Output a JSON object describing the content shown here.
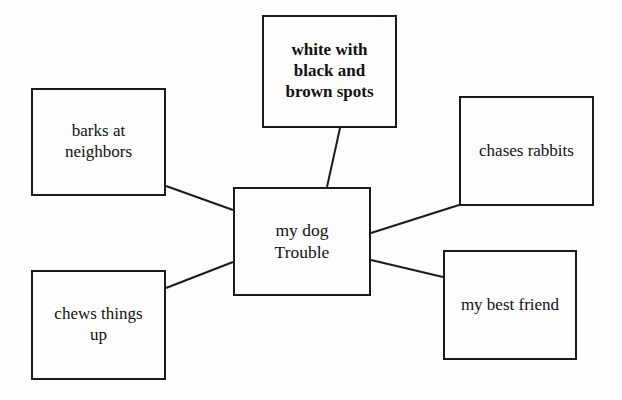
{
  "diagram": {
    "type": "concept-map",
    "center": {
      "id": "center",
      "label": "my dog\nTrouble",
      "x": 233,
      "y": 187,
      "width": 138,
      "height": 109
    },
    "nodes": [
      {
        "id": "appearance",
        "label": "white with\nblack and\nbrown spots",
        "style": "emphasis",
        "x": 262,
        "y": 15,
        "width": 135,
        "height": 113
      },
      {
        "id": "barks",
        "label": "barks at\nneighbors",
        "style": "plain",
        "x": 31,
        "y": 88,
        "width": 135,
        "height": 108
      },
      {
        "id": "chases",
        "label": "chases rabbits",
        "style": "plain",
        "x": 459,
        "y": 96,
        "width": 135,
        "height": 110
      },
      {
        "id": "chews",
        "label": "chews things\nup",
        "style": "plain",
        "x": 31,
        "y": 270,
        "width": 135,
        "height": 110
      },
      {
        "id": "friend",
        "label": "my best friend",
        "style": "plain",
        "x": 443,
        "y": 250,
        "width": 134,
        "height": 110
      }
    ],
    "edges": [
      {
        "id": "edge-appearance",
        "from": "appearance",
        "to": "center",
        "x1": 340,
        "y1": 128,
        "x2": 327,
        "y2": 187
      },
      {
        "id": "edge-barks",
        "from": "barks",
        "to": "center",
        "x1": 166,
        "y1": 186,
        "x2": 233,
        "y2": 210
      },
      {
        "id": "edge-chews",
        "from": "chews",
        "to": "center",
        "x1": 166,
        "y1": 288,
        "x2": 233,
        "y2": 262
      },
      {
        "id": "edge-chases",
        "from": "center",
        "to": "chases",
        "x1": 371,
        "y1": 233,
        "x2": 459,
        "y2": 205
      },
      {
        "id": "edge-friend",
        "from": "center",
        "to": "friend",
        "x1": 371,
        "y1": 260,
        "x2": 443,
        "y2": 277
      }
    ],
    "colors": {
      "line": "#1b1b1b",
      "text": "#111111",
      "background": "#fdfdfd"
    }
  }
}
